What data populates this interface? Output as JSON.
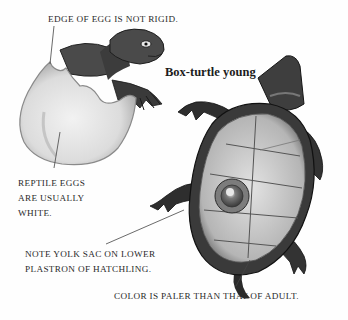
{
  "title": "Box-turtle young",
  "captions": {
    "egg_edge": "EDGE OF EGG IS NOT RIGID.",
    "egg_color": [
      "REPTILE EGGS",
      "ARE USUALLY",
      "WHITE."
    ],
    "yolk_sac": [
      "NOTE YOLK SAC ON LOWER",
      "PLASTRON OF HATCHLING."
    ],
    "color_note": "COLOR IS PALER THAN THAT OF  ADULT."
  },
  "illustrations": {
    "hatching_egg": "turtle hatchling emerging from white egg",
    "upside_down_hatchling": "box-turtle hatchling upside down showing plastron with yolk sac"
  },
  "colors": {
    "text": "#2a2a2a",
    "egg": "#e4e4e4",
    "shell_dark": "#3a3a3a",
    "plastron": "#c8c8c8"
  }
}
